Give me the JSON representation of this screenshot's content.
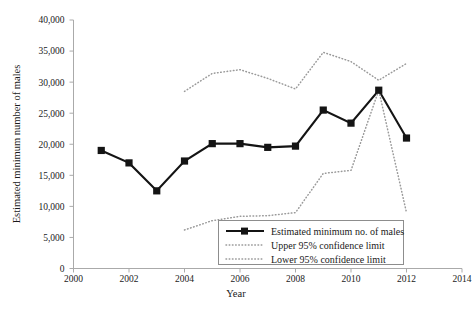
{
  "chart_data": {
    "type": "line",
    "title": "",
    "xlabel": "Year",
    "ylabel": "Estimated minimum number of males",
    "xlim": [
      2000,
      2014
    ],
    "ylim": [
      0,
      40000
    ],
    "xticks": [
      2000,
      2002,
      2004,
      2006,
      2008,
      2010,
      2012,
      2014
    ],
    "xtick_labels": [
      "2000",
      "2002",
      "2004",
      "2006",
      "2008",
      "2010",
      "2012",
      "2014"
    ],
    "yticks": [
      0,
      5000,
      10000,
      15000,
      20000,
      25000,
      30000,
      35000,
      40000
    ],
    "ytick_labels": [
      "0",
      "5,000",
      "10,000",
      "15,000",
      "20,000",
      "25,000",
      "30,000",
      "35,000",
      "40,000"
    ],
    "grid": false,
    "legend_position": "inside-bottom-right",
    "series": [
      {
        "name": "Estimated minimum no. of males",
        "style": "solid-square-marker",
        "color": "#141414",
        "x": [
          2001,
          2002,
          2003,
          2004,
          2005,
          2006,
          2007,
          2008,
          2009,
          2010,
          2011,
          2012
        ],
        "values": [
          19000,
          17000,
          12500,
          17300,
          20100,
          20100,
          19500,
          19700,
          25500,
          23400,
          28700,
          21000
        ]
      },
      {
        "name": "Upper 95% confidence limit",
        "style": "dotted",
        "color": "#9a9a9a",
        "x": [
          2004,
          2005,
          2006,
          2007,
          2008,
          2009,
          2010,
          2011,
          2012
        ],
        "values": [
          28500,
          31400,
          32000,
          30600,
          28900,
          34800,
          33300,
          30300,
          33000
        ]
      },
      {
        "name": "Lower 95% confidence limit",
        "style": "dotted",
        "color": "#9a9a9a",
        "x": [
          2004,
          2005,
          2006,
          2007,
          2008,
          2009,
          2010,
          2011,
          2012
        ],
        "values": [
          6200,
          7700,
          8400,
          8500,
          9000,
          15300,
          15800,
          28700,
          9000
        ]
      }
    ]
  },
  "legend": {
    "items": [
      {
        "label": "Estimated minimum no. of males",
        "marker": "line-with-square"
      },
      {
        "label": "Upper 95% confidence limit",
        "marker": "dotted-line"
      },
      {
        "label": "Lower 95% confidence limit",
        "marker": "dotted-line"
      }
    ]
  }
}
